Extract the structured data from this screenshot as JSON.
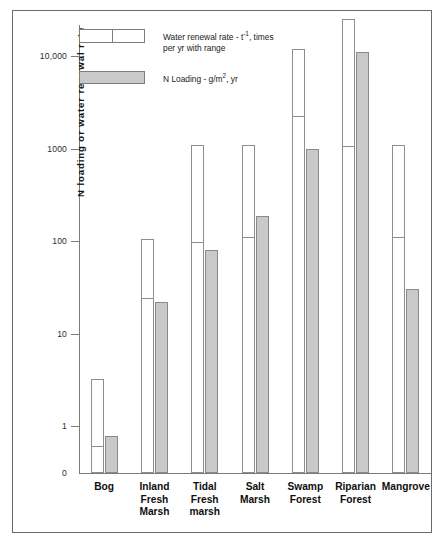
{
  "chart_data": {
    "type": "bar",
    "title": "",
    "xlabel": "",
    "ylabel": "N loading or water renewal rate",
    "scale": "log",
    "ylim": [
      0.35,
      30000
    ],
    "grid": false,
    "categories": [
      "Bog",
      "Inland Fresh Marsh",
      "Tidal Fresh marsh",
      "Salt Marsh",
      "Swamp Forest",
      "Riparian Forest",
      "Mangrove"
    ],
    "category_label_lines": [
      [
        "Bog"
      ],
      [
        "Inland",
        "Fresh",
        "Marsh"
      ],
      [
        "Tidal",
        "Fresh",
        "marsh"
      ],
      [
        "Salt",
        "Marsh"
      ],
      [
        "Swamp",
        "Forest"
      ],
      [
        "Riparian",
        "Forest"
      ],
      [
        "Mangrove"
      ]
    ],
    "ytick_labels": [
      "10,000",
      "1000",
      "100",
      "10",
      "1",
      "0"
    ],
    "ytick_values": [
      10000,
      1000,
      100,
      10,
      1,
      0
    ],
    "series": [
      {
        "name": "Water renewal rate - t-1, times per yr with range",
        "key": "water_renewal_rate",
        "fill": "white",
        "range_high": [
          3.2,
          105,
          1100,
          1100,
          12000,
          25000,
          1100
        ],
        "range_low": [
          0.62,
          25,
          100,
          112,
          2300,
          1080,
          112
        ]
      },
      {
        "name": "N Loading - g/m2, yr",
        "key": "n_loading",
        "fill": "gray",
        "values": [
          0.78,
          22,
          80,
          185,
          980,
          11000,
          30
        ]
      }
    ]
  },
  "legend": {
    "items": [
      {
        "swatch": "white-range-swatch",
        "line1_prefix": "Water renewal rate - t",
        "line1_sup": "-1",
        "line1_suffix": ", times",
        "line2": "per yr with range"
      },
      {
        "swatch": "gray-swatch",
        "line1_prefix": "N Loading - g/m",
        "line1_sup": "2",
        "line1_suffix": ", yr",
        "line2": ""
      }
    ]
  },
  "axis": {
    "y_title": "N loading or water renewal rate"
  },
  "colors": {
    "gray_fill": "#c9c9c9",
    "white_fill": "#ffffff",
    "stroke": "#8a8a8a",
    "axis": "#7a7a7a",
    "frame": "#6a6a6a",
    "text": "#141414"
  }
}
